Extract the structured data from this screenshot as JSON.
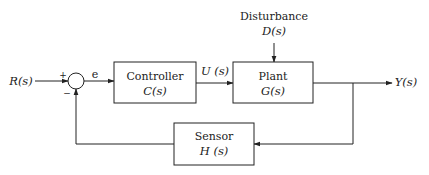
{
  "diagram": {
    "type": "feedback-control-block-diagram",
    "input": {
      "label": "R(s)"
    },
    "summing_junction": {
      "plus_sign": "+",
      "minus_sign": "−"
    },
    "error_signal": {
      "label": "e"
    },
    "blocks": {
      "controller": {
        "title": "Controller",
        "transfer": "C(s)"
      },
      "plant": {
        "title": "Plant",
        "transfer": "G(s)"
      },
      "sensor": {
        "title": "Sensor",
        "transfer": "H (s)"
      }
    },
    "control_signal": {
      "label": "U (s)"
    },
    "disturbance": {
      "title": "Disturbance",
      "transfer": "D(s)"
    },
    "output": {
      "label": "Y(s)"
    },
    "connections": [
      {
        "from": "R(s)",
        "to": "summing_junction",
        "sign": "+"
      },
      {
        "from": "summing_junction",
        "to": "controller",
        "label": "e"
      },
      {
        "from": "controller",
        "to": "plant",
        "label": "U(s)"
      },
      {
        "from": "disturbance",
        "to": "plant"
      },
      {
        "from": "plant",
        "to": "Y(s)"
      },
      {
        "from": "Y(s)",
        "to": "sensor"
      },
      {
        "from": "sensor",
        "to": "summing_junction",
        "sign": "−"
      }
    ]
  }
}
